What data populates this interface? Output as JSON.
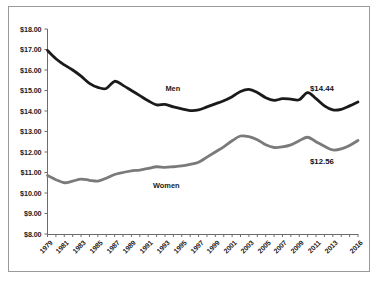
{
  "chart_data": {
    "type": "line",
    "title": "",
    "subtitle": "",
    "xlabel": "",
    "ylabel": "",
    "grid": false,
    "legend_position": "inline-annotations",
    "ylim": [
      8.0,
      18.0
    ],
    "ytick_step": 1.0,
    "ytick_labels": [
      "$18.00",
      "$17.00",
      "$16.00",
      "$15.00",
      "$14.00",
      "$13.00",
      "$12.00",
      "$11.00",
      "$10.00",
      "$9.00",
      "$8.00"
    ],
    "ytick_values": [
      18.0,
      17.0,
      16.0,
      15.0,
      14.0,
      13.0,
      12.0,
      11.0,
      10.0,
      9.0,
      8.0
    ],
    "x": [
      1979,
      1980,
      1981,
      1982,
      1983,
      1984,
      1985,
      1986,
      1987,
      1988,
      1989,
      1990,
      1991,
      1992,
      1993,
      1994,
      1995,
      1996,
      1997,
      1998,
      1999,
      2000,
      2001,
      2002,
      2003,
      2004,
      2005,
      2006,
      2007,
      2008,
      2009,
      2010,
      2011,
      2012,
      2013,
      2014,
      2015,
      2016
    ],
    "xtick_labels": [
      "1979",
      "1981",
      "1983",
      "1985",
      "1987",
      "1989",
      "1991",
      "1993",
      "1995",
      "1997",
      "1999",
      "2001",
      "2003",
      "2005",
      "2007",
      "2009",
      "2011",
      "2013",
      "2016"
    ],
    "xtick_label_years": [
      1979,
      1981,
      1983,
      1985,
      1987,
      1989,
      1991,
      1993,
      1995,
      1997,
      1999,
      2001,
      2003,
      2005,
      2007,
      2009,
      2011,
      2013,
      2016
    ],
    "series": [
      {
        "name": "Men",
        "color": "#1a1a1a",
        "label_text": "Men",
        "end_value_label": "$14.44",
        "end_value": 14.44,
        "values": [
          16.95,
          16.55,
          16.25,
          16.0,
          15.7,
          15.35,
          15.15,
          15.1,
          15.45,
          15.25,
          15.0,
          14.75,
          14.5,
          14.3,
          14.32,
          14.2,
          14.1,
          14.02,
          14.05,
          14.2,
          14.35,
          14.5,
          14.7,
          14.95,
          15.05,
          14.9,
          14.65,
          14.52,
          14.6,
          14.58,
          14.55,
          14.9,
          14.6,
          14.25,
          14.05,
          14.08,
          14.25,
          14.44
        ]
      },
      {
        "name": "Women",
        "color": "#7a7a7a",
        "label_text": "Women",
        "end_value_label": "$12.56",
        "end_value": 12.56,
        "values": [
          10.85,
          10.65,
          10.5,
          10.58,
          10.68,
          10.62,
          10.58,
          10.72,
          10.9,
          11.0,
          11.08,
          11.12,
          11.2,
          11.28,
          11.25,
          11.28,
          11.32,
          11.4,
          11.5,
          11.75,
          12.0,
          12.25,
          12.55,
          12.78,
          12.75,
          12.6,
          12.35,
          12.22,
          12.25,
          12.35,
          12.55,
          12.72,
          12.5,
          12.28,
          12.1,
          12.15,
          12.32,
          12.56
        ]
      }
    ],
    "annotations": [
      {
        "name": "men-series-label",
        "text": "Men",
        "x": 1994,
        "y": 15.1
      },
      {
        "name": "women-series-label",
        "text": "Women",
        "x": 1993,
        "y": 10.4
      },
      {
        "name": "men-end-value",
        "text": "$14.44",
        "x": 2011,
        "y": 15.1
      },
      {
        "name": "women-end-value",
        "text": "$12.56",
        "x": 2011,
        "y": 11.55
      }
    ]
  }
}
